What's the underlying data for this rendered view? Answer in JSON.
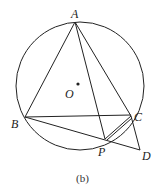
{
  "diagram": {
    "caption": "(b)",
    "points": {
      "A": {
        "label": "A",
        "x": 75,
        "y": 22
      },
      "B": {
        "label": "B",
        "x": 25,
        "y": 117
      },
      "C": {
        "label": "C",
        "x": 131,
        "y": 116
      },
      "P": {
        "label": "P",
        "x": 105,
        "y": 139
      },
      "D": {
        "label": "D",
        "x": 140,
        "y": 150
      },
      "O": {
        "label": "O",
        "x": 78,
        "y": 84
      }
    },
    "circle": {
      "cx": 80,
      "cy": 86,
      "r": 64
    },
    "segments": [
      "AB",
      "AC",
      "AP",
      "BC",
      "BD",
      "CD",
      "PC"
    ],
    "colors": {
      "stroke": "#222222",
      "background": "#ffffff"
    }
  }
}
